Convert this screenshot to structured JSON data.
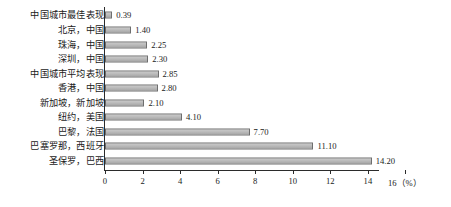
{
  "chart_data": {
    "type": "bar",
    "orientation": "horizontal",
    "title": "",
    "xlabel": "(%)",
    "ylabel": "",
    "xlim": [
      0,
      16
    ],
    "xticks": [
      0,
      2,
      4,
      6,
      8,
      10,
      12,
      14,
      16
    ],
    "grid": false,
    "legend": null,
    "bar_color": "#bdbdbd",
    "bar_edge_color": "#6e6e6e",
    "axis_color": "#2b2b2b",
    "categories": [
      "中国城市最佳表现",
      "北京，中国",
      "珠海，中国",
      "深圳，中国",
      "中国城市平均表现",
      "香港，中国",
      "新加坡，新加坡",
      "纽约，美国",
      "巴黎，法国",
      "巴塞罗那，西班牙",
      "圣保罗，巴西"
    ],
    "values": [
      0.39,
      1.4,
      2.25,
      2.3,
      2.85,
      2.8,
      2.1,
      4.1,
      7.7,
      11.1,
      14.2
    ],
    "value_labels": [
      "0.39",
      "1.40",
      "2.25",
      "2.30",
      "2.85",
      "2.80",
      "2.10",
      "4.10",
      "7.70",
      "11.10",
      "14.20"
    ],
    "unit": "%"
  },
  "axis": {
    "unit_label": "16（%）",
    "tick_labels": [
      "0",
      "2",
      "4",
      "6",
      "8",
      "10",
      "12",
      "14"
    ]
  },
  "caption": {
    "text": ""
  }
}
